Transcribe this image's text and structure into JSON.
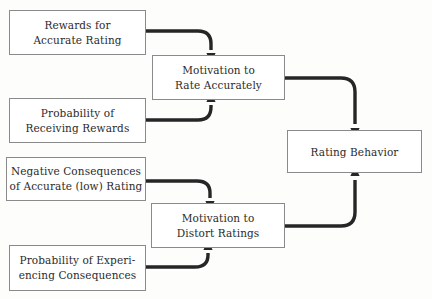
{
  "diagram": {
    "background_color": "#fdfdfc",
    "box_border_color": "#8a8a8a",
    "arrow_color": "#262626",
    "text_color": "#2b2b2b",
    "nodes": [
      {
        "id": "rewards-for-accurate-rating",
        "name": "rewards-for-accurate-rating-box",
        "line1": "Rewards for",
        "line2": "Accurate Rating",
        "x": 9,
        "y": 10,
        "width": 137,
        "height": 45
      },
      {
        "id": "probability-of-receiving-rewards",
        "name": "probability-of-receiving-rewards-box",
        "line1": "Probability of",
        "line2": "Receiving Rewards",
        "x": 9,
        "y": 98,
        "width": 137,
        "height": 45
      },
      {
        "id": "negative-consequences",
        "name": "negative-consequences-box",
        "line1": "Negative Consequences",
        "line2": "of Accurate (low) Rating",
        "x": 6,
        "y": 157,
        "width": 140,
        "height": 44
      },
      {
        "id": "probability-of-experiencing-consequences",
        "name": "probability-of-experiencing-consequences-box",
        "line1": "Probability of Experi-",
        "line2": "encing Consequences",
        "x": 9,
        "y": 245,
        "width": 137,
        "height": 46
      },
      {
        "id": "motivation-to-rate-accurately",
        "name": "motivation-to-rate-accurately-box",
        "line1": "Motivation to",
        "line2": "Rate Accurately",
        "x": 152,
        "y": 55,
        "width": 133,
        "height": 45
      },
      {
        "id": "motivation-to-distort-ratings",
        "name": "motivation-to-distort-ratings-box",
        "line1": "Motivation to",
        "line2": "Distort Ratings",
        "x": 151,
        "y": 203,
        "width": 134,
        "height": 45
      },
      {
        "id": "rating-behavior",
        "name": "rating-behavior-box",
        "line1": "Rating Behavior",
        "line2": "",
        "x": 287,
        "y": 130,
        "width": 135,
        "height": 43
      }
    ],
    "edges": [
      {
        "id": "edge-rewards-to-motivation-accurate",
        "name": "arrow-rewards-to-motivation-rate-accurately",
        "from": "rewards-for-accurate-rating",
        "to": "motivation-to-rate-accurately",
        "path": "M 146 31 L 198 31 Q 211 31 211 44 L 211 50",
        "head_x": 211,
        "head_y": 54,
        "head_dir": "down"
      },
      {
        "id": "edge-probability-rewards-to-motivation-accurate",
        "name": "arrow-probability-rewards-to-motivation-rate-accurately",
        "from": "probability-of-receiving-rewards",
        "to": "motivation-to-rate-accurately",
        "path": "M 146 120 L 198 120 Q 211 120 211 107 L 211 105",
        "head_x": 211,
        "head_y": 101,
        "head_dir": "up"
      },
      {
        "id": "edge-negative-to-motivation-distort",
        "name": "arrow-negative-consequences-to-motivation-distort",
        "from": "negative-consequences",
        "to": "motivation-to-distort-ratings",
        "path": "M 146 181 L 197 181 Q 210 181 210 193 L 210 198",
        "head_x": 210,
        "head_y": 202,
        "head_dir": "down"
      },
      {
        "id": "edge-probability-consequences-to-motivation-distort",
        "name": "arrow-probability-consequences-to-motivation-distort",
        "from": "probability-of-experiencing-consequences",
        "to": "motivation-to-distort-ratings",
        "path": "M 143 267 L 195 267 Q 208 267 208 255 L 208 253",
        "head_x": 208,
        "head_y": 249,
        "head_dir": "up"
      },
      {
        "id": "edge-motivation-accurate-to-rating-behavior",
        "name": "arrow-motivation-rate-accurately-to-rating-behavior",
        "from": "motivation-to-rate-accurately",
        "to": "rating-behavior",
        "path": "M 285 78 L 341 78 Q 355 78 355 92 L 355 124",
        "head_x": 355,
        "head_y": 129,
        "head_dir": "down"
      },
      {
        "id": "edge-motivation-distort-to-rating-behavior",
        "name": "arrow-motivation-distort-to-rating-behavior",
        "from": "motivation-to-distort-ratings",
        "to": "rating-behavior",
        "path": "M 285 226 L 341 226 Q 355 226 355 212 L 355 180",
        "head_x": 355,
        "head_y": 175,
        "head_dir": "up"
      }
    ]
  }
}
